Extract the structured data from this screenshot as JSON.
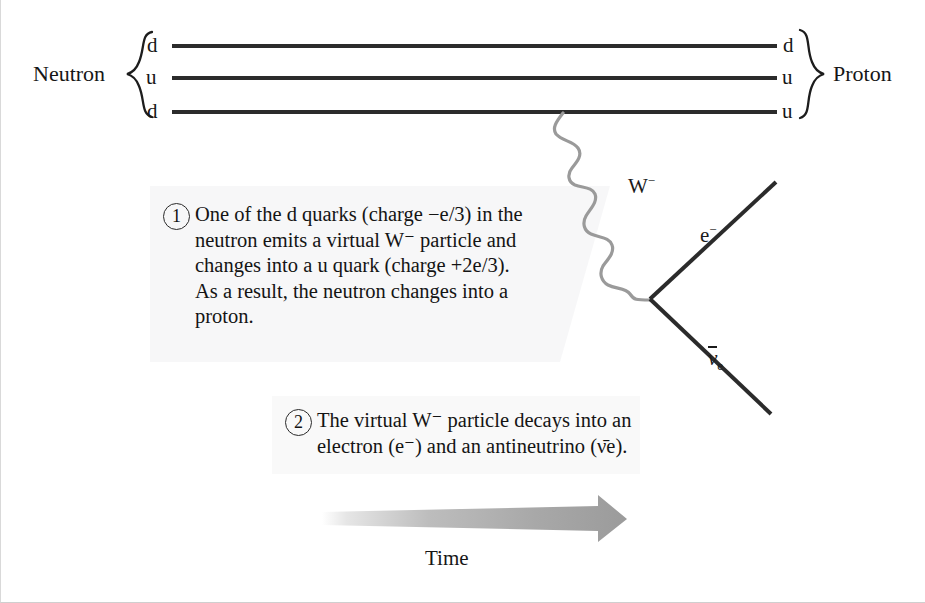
{
  "figure": {
    "background_color": "#ffffff",
    "line_color": "#2b2b2b",
    "boson_color": "#9a9a9a",
    "text_color": "#141414"
  },
  "left_group": {
    "label": "Neutron",
    "brace": "{",
    "quarks": [
      "d",
      "u",
      "d"
    ]
  },
  "right_group": {
    "label": "Proton",
    "brace": "}",
    "quarks": [
      "d",
      "u",
      "u"
    ]
  },
  "boson": {
    "label_w": "W",
    "label_charge": "−",
    "name": "W-minus boson"
  },
  "products": {
    "electron": {
      "symbol": "e",
      "charge": "−"
    },
    "antineutrino": {
      "symbol": "ν",
      "subscript": "e",
      "overbar": true
    }
  },
  "callouts": [
    {
      "number": "1",
      "lines": [
        "One of the d quarks (charge −e/3) in the",
        "neutron emits a virtual W⁻ particle and",
        "changes into a u quark (charge +2e/3).",
        "As a result, the neutron changes into a",
        "proton."
      ],
      "text_plain": "One of the d quarks (charge −e/3) in the neutron emits a virtual W⁻ particle and changes into a u quark (charge +2e/3). As a result, the neutron changes into a proton."
    },
    {
      "number": "2",
      "lines": [
        "The virtual W⁻ particle decays into an",
        "electron (e⁻) and an antineutrino (ν̄e)."
      ],
      "text_plain": "The virtual W⁻ particle decays into an electron (e⁻) and an antineutrino (ν̄e)."
    }
  ],
  "time_axis": {
    "label": "Time",
    "direction": "left-to-right",
    "arrow_color": "#9b9b9b"
  }
}
